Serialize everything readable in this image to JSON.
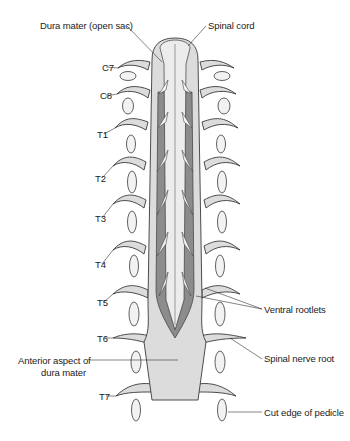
{
  "figure": {
    "colors": {
      "dura": "#dcdcdc",
      "dura_edge": "#3a3a3a",
      "cavity": "#8c8c8c",
      "cord": "#ececec",
      "rootlet": "#f4f4f4",
      "pedicle": "#f2f2f2",
      "background": "#ffffff"
    }
  },
  "labels": {
    "dura_open_sac": "Dura mater (open sac)",
    "spinal_cord": "Spinal cord",
    "ventral_rootlets": "Ventral rootlets",
    "spinal_nerve_root": "Spinal nerve root",
    "anterior_aspect_line1": "Anterior aspect of",
    "anterior_aspect_line2": "dura mater",
    "cut_edge_pedicle": "Cut edge of pedicle"
  },
  "levels": [
    "C7",
    "C8",
    "T1",
    "T2",
    "T3",
    "T4",
    "T5",
    "T6",
    "T7"
  ]
}
